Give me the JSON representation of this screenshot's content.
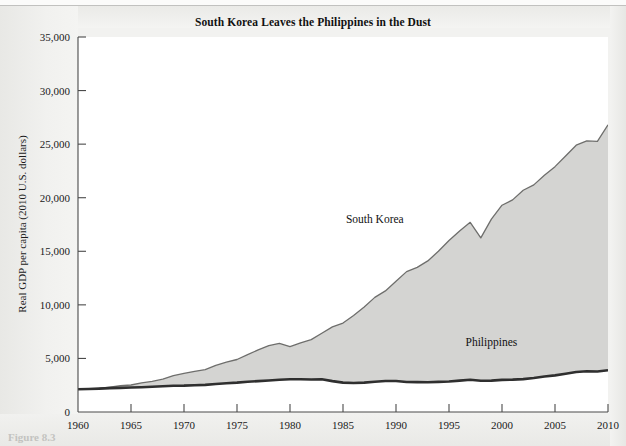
{
  "page": {
    "caption_partial": "Figure 8.3"
  },
  "chart_data": {
    "type": "area",
    "title": "South Korea Leaves the Philippines in the Dust",
    "xlabel": "",
    "ylabel": "Real GDP per capita (2010 U.S. dollars)",
    "xlim": [
      1960,
      2010
    ],
    "ylim": [
      0,
      35000
    ],
    "xticks": [
      1960,
      1965,
      1970,
      1975,
      1980,
      1985,
      1990,
      1995,
      2000,
      2005,
      2010
    ],
    "xtick_labels": [
      "1960",
      "1965",
      "1970",
      "1975",
      "1980",
      "1985",
      "1990",
      "1995",
      "2000",
      "2005",
      "2010"
    ],
    "yticks": [
      0,
      5000,
      10000,
      15000,
      20000,
      25000,
      30000,
      35000
    ],
    "ytick_labels": [
      "0",
      "5,000",
      "10,000",
      "15,000",
      "20,000",
      "25,000",
      "30,000",
      "35,000"
    ],
    "grid": false,
    "legend_position": "inline-annotations",
    "fill_color": "#d4d4d2",
    "line_color": "#3a3a3a",
    "annotations": [
      {
        "text": "South Korea",
        "x": 1988,
        "y": 17600
      },
      {
        "text": "Philippines",
        "x": 1999,
        "y": 6200
      }
    ],
    "x": [
      1960,
      1961,
      1962,
      1963,
      1964,
      1965,
      1966,
      1967,
      1968,
      1969,
      1970,
      1971,
      1972,
      1973,
      1974,
      1975,
      1976,
      1977,
      1978,
      1979,
      1980,
      1981,
      1982,
      1983,
      1984,
      1985,
      1986,
      1987,
      1988,
      1989,
      1990,
      1991,
      1992,
      1993,
      1994,
      1995,
      1996,
      1997,
      1998,
      1999,
      2000,
      2001,
      2002,
      2003,
      2004,
      2005,
      2006,
      2007,
      2008,
      2009,
      2010
    ],
    "series": [
      {
        "name": "South Korea",
        "values": [
          2150,
          2180,
          2210,
          2330,
          2450,
          2520,
          2720,
          2850,
          3060,
          3400,
          3600,
          3800,
          3950,
          4350,
          4650,
          4900,
          5350,
          5800,
          6200,
          6400,
          6100,
          6450,
          6750,
          7350,
          7950,
          8300,
          9000,
          9800,
          10700,
          11300,
          12200,
          13100,
          13500,
          14100,
          15000,
          16000,
          16900,
          17700,
          16250,
          18000,
          19300,
          19800,
          20700,
          21200,
          22100,
          22900,
          23900,
          24900,
          25300,
          25250,
          26800
        ]
      },
      {
        "name": "Philippines",
        "values": [
          2120,
          2150,
          2180,
          2230,
          2250,
          2280,
          2310,
          2350,
          2400,
          2450,
          2460,
          2500,
          2530,
          2620,
          2680,
          2740,
          2830,
          2880,
          2940,
          3010,
          3050,
          3060,
          3040,
          3060,
          2880,
          2740,
          2700,
          2740,
          2820,
          2890,
          2890,
          2800,
          2790,
          2780,
          2810,
          2840,
          2930,
          3010,
          2920,
          2930,
          3000,
          3020,
          3070,
          3170,
          3310,
          3420,
          3570,
          3740,
          3800,
          3780,
          3900
        ]
      }
    ]
  }
}
